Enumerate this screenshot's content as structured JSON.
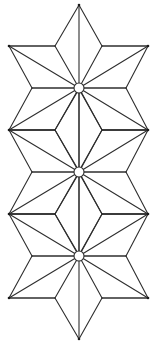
{
  "figure": {
    "colors": {
      "background": "#ffffff",
      "line": "#2e2e2e",
      "hub_fill": "#ffffff"
    },
    "stars": [
      {
        "center": [
          79,
          88
        ]
      },
      {
        "center": [
          79,
          172
        ]
      },
      {
        "center": [
          79,
          256
        ]
      }
    ],
    "geometry": {
      "outer_left_x": 9,
      "outer_right_x": 148,
      "inner_left_x": 55,
      "inner_right_x": 102,
      "concave_left_x": 32,
      "concave_right_x": 126,
      "half_step": 42,
      "tip_reach": 83,
      "hub_radius": 5
    }
  }
}
